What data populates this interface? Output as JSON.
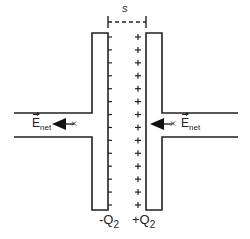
{
  "diagram": {
    "separation_label": "s",
    "left_plate": {
      "charge_label": "-Q",
      "charge_subscript": "2",
      "sign": "-",
      "sign_count": 14
    },
    "right_plate": {
      "charge_label": "+Q",
      "charge_subscript": "2",
      "sign": "+",
      "sign_count": 14
    },
    "left_field": {
      "symbol": "E",
      "subscript": "net",
      "direction": "left",
      "point_mark": "x"
    },
    "right_field": {
      "symbol": "E",
      "subscript": "net",
      "direction": "left",
      "point_mark": "x"
    },
    "colors": {
      "line": "#222222",
      "background": "#ffffff"
    }
  }
}
